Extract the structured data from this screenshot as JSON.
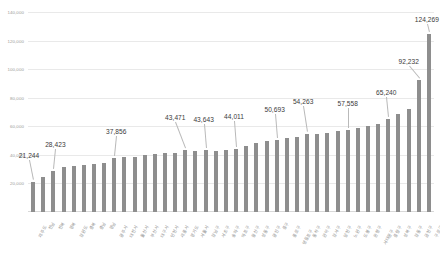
{
  "chart_data": {
    "type": "bar",
    "title": "",
    "xlabel": "",
    "ylabel": "",
    "ylim": [
      0,
      140000
    ],
    "grid": true,
    "legend": "none",
    "y_ticks": [
      20000,
      40000,
      60000,
      80000,
      100000,
      120000,
      140000
    ],
    "y_tick_labels": [
      "20,000",
      "40,000",
      "60,000",
      "80,000",
      "100,000",
      "120,000",
      "140,000"
    ],
    "bar_color": "#8e8e8e",
    "categories": [
      "제주도",
      "전남",
      "전북",
      "경북",
      "강원도",
      "충북",
      "충남",
      "경남",
      "광주시",
      "대전시",
      "울산시",
      "부산시",
      "대구시",
      "인천시",
      "세종시",
      "경기도",
      "서울시",
      "강남구",
      "서초구",
      "송파구",
      "마포구",
      "용산구",
      "성동구",
      "광진구",
      "중구",
      "종로구",
      "영등포구",
      "동작구",
      "관악구",
      "강서구",
      "양천구",
      "노원구",
      "도봉구",
      "은평구",
      "서대문구",
      "중랑구",
      "성북구",
      "강동구",
      "금천구",
      "구로구"
    ],
    "values": [
      21244,
      24800,
      28423,
      31200,
      32400,
      33000,
      33600,
      34200,
      37856,
      38600,
      38400,
      39600,
      40400,
      41000,
      41600,
      43471,
      42900,
      43643,
      42800,
      43200,
      44011,
      46400,
      48200,
      49400,
      50693,
      51800,
      52400,
      54263,
      54800,
      55600,
      56400,
      57558,
      58600,
      60200,
      61400,
      65240,
      68400,
      72400,
      92232,
      124269
    ],
    "labeled_points": [
      {
        "index": 0,
        "label": "21,244"
      },
      {
        "index": 2,
        "label": "28,423"
      },
      {
        "index": 8,
        "label": "37,856"
      },
      {
        "index": 15,
        "label": "43,471"
      },
      {
        "index": 17,
        "label": "43,643"
      },
      {
        "index": 20,
        "label": "44,011"
      },
      {
        "index": 24,
        "label": "50,693"
      },
      {
        "index": 27,
        "label": "54,263"
      },
      {
        "index": 31,
        "label": "57,558"
      },
      {
        "index": 35,
        "label": "65,240"
      },
      {
        "index": 38,
        "label": "92,232"
      },
      {
        "index": 39,
        "label": "124,269"
      }
    ]
  }
}
